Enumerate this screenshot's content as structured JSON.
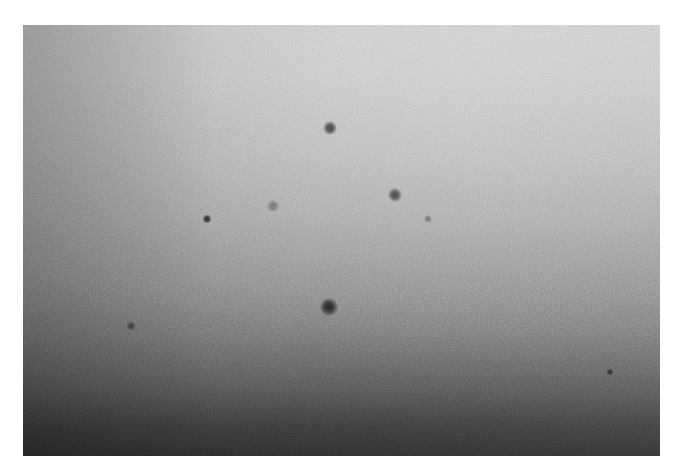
{
  "image": {
    "description": "Grainy grayscale photograph of a textured surface with a light-to-dark vertical gradient and several small dark spots",
    "frame": {
      "left": 23,
      "top": 25,
      "width": 637,
      "height": 431
    },
    "colors": {
      "top": "#c9c9c9",
      "middle": "#8a8a8a",
      "bottom": "#2c2c2c",
      "border": "#ffffff"
    },
    "spots": [
      {
        "name": "spot-upper-center",
        "x": 330,
        "y": 128,
        "size": 14,
        "color": "#4a4a4a"
      },
      {
        "name": "spot-upper-right",
        "x": 395,
        "y": 195,
        "size": 14,
        "color": "#4f4f4f"
      },
      {
        "name": "spot-left",
        "x": 207,
        "y": 219,
        "size": 9,
        "color": "#2e2e2e"
      },
      {
        "name": "spot-faint-left-center",
        "x": 273,
        "y": 206,
        "size": 12,
        "color": "#7a7a7a"
      },
      {
        "name": "spot-faint-right",
        "x": 428,
        "y": 219,
        "size": 8,
        "color": "#7c7c7c"
      },
      {
        "name": "spot-lower-center",
        "x": 329,
        "y": 307,
        "size": 18,
        "color": "#2a2a2a"
      },
      {
        "name": "spot-lower-left",
        "x": 131,
        "y": 326,
        "size": 9,
        "color": "#3f3f3f"
      },
      {
        "name": "spot-lower-right",
        "x": 610,
        "y": 372,
        "size": 7,
        "color": "#333333"
      }
    ]
  }
}
